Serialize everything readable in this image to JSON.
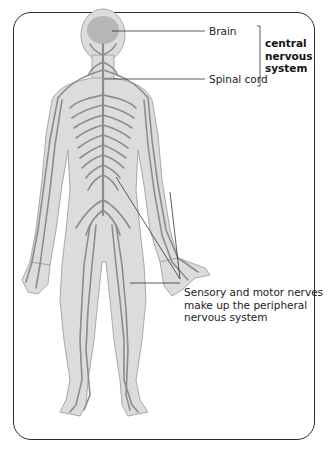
{
  "diagram": {
    "labels": {
      "brain": "Brain",
      "spinal_cord": "Spinal cord",
      "cns_line1": "central",
      "cns_line2": "nervous",
      "cns_line3": "system",
      "pns_line1": "Sensory and motor nerves",
      "pns_line2": "make up the peripheral",
      "pns_line3": "nervous system"
    },
    "colors": {
      "body_fill": "#dcdcdc",
      "body_outline": "#a8a8a8",
      "nerve": "#8c8c8c",
      "brain": "#a9a9a9",
      "leader_line": "#333333",
      "frame": "#2b2b2b"
    }
  }
}
